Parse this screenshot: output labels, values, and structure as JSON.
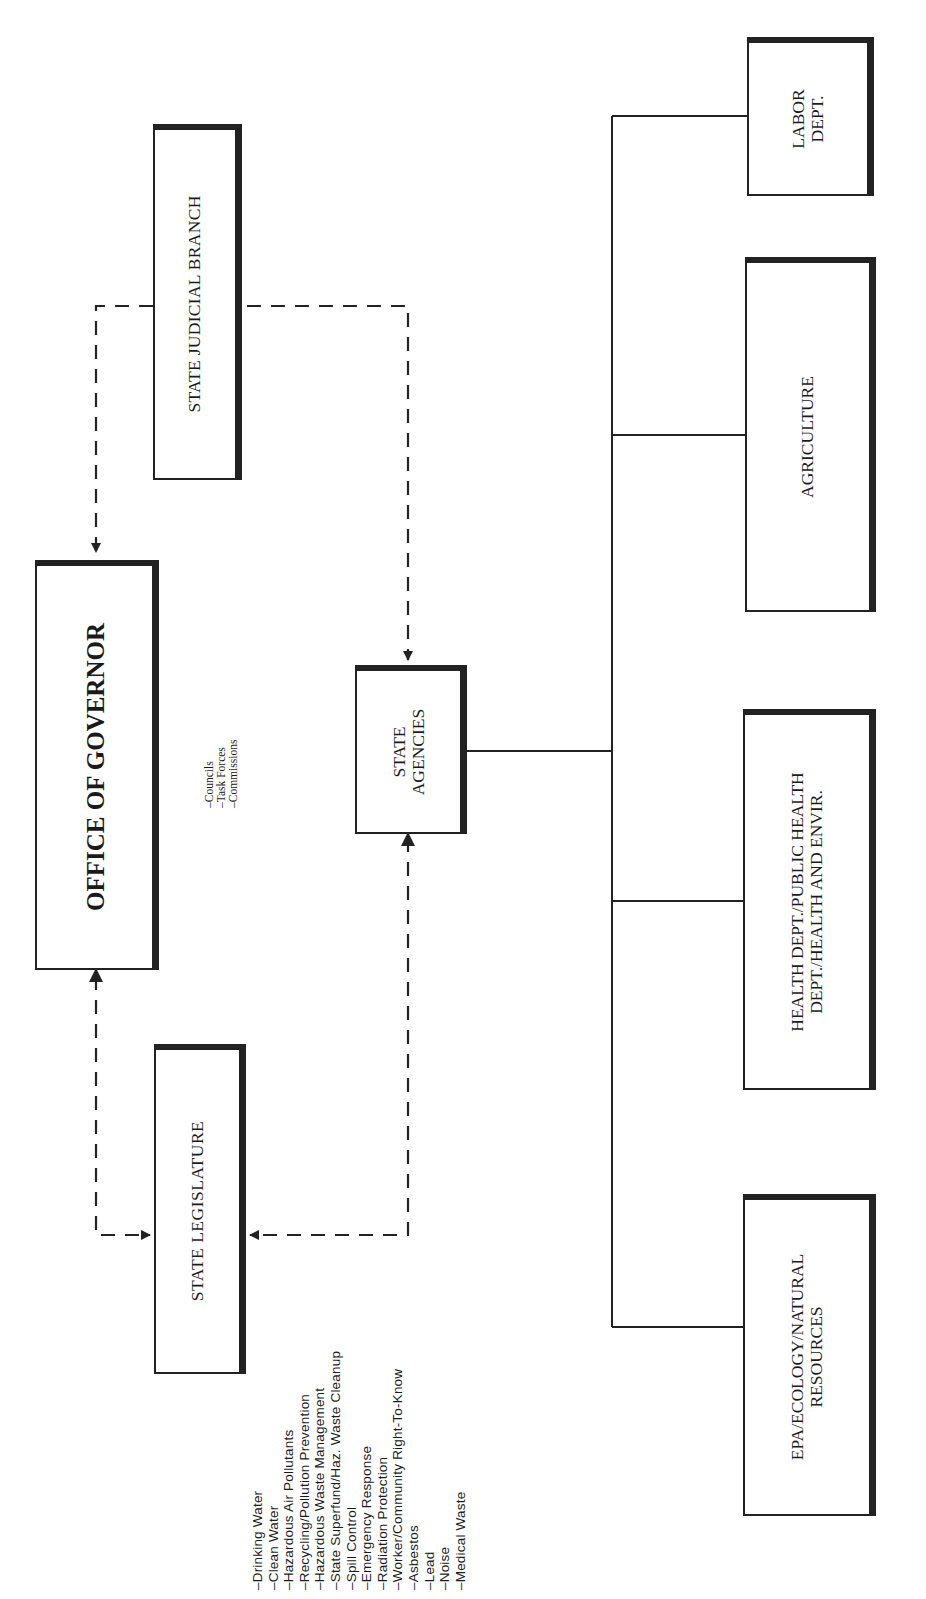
{
  "diagram": {
    "type": "organizational-chart",
    "orientation": "rotated-90-counterclockwise",
    "nodes": {
      "governor": {
        "label": "OFFICE OF GOVERNOR",
        "sub_items": [
          "–Councils",
          "–Task Forces",
          "–Commissions"
        ]
      },
      "judicial": {
        "label": "STATE JUDICIAL BRANCH"
      },
      "legislature": {
        "label": "STATE  LEGISLATURE",
        "program_list": [
          "–Drinking  Water",
          "–Clean  Water",
          "–Hazardous  Air  Pollutants",
          "–Recycling/Pollution  Prevention",
          "–Hazardous  Waste  Management",
          "–State  Superfund/Haz.  Waste  Cleanup",
          "–Spill  Control",
          "–Emergency  Response",
          "–Radiation  Protection",
          "–Worker/Community  Right-To-Know",
          "–Asbestos",
          "–Lead",
          "–Noise",
          "–Medical  Waste"
        ]
      },
      "agencies": {
        "label_line1": "STATE",
        "label_line2": "AGENCIES"
      },
      "labor": {
        "label_line1": "LABOR",
        "label_line2": "DEPT."
      },
      "agriculture": {
        "label": "AGRICULTURE"
      },
      "health": {
        "label_line1": "HEALTH DEPT./PUBLIC HEALTH",
        "label_line2": "DEPT./HEALTH AND ENVIR."
      },
      "epa": {
        "label_line1": "EPA/ECOLOGY/NATURAL",
        "label_line2": "RESOURCES"
      }
    },
    "edges": [
      {
        "from": "judicial",
        "to": "governor",
        "style": "dashed",
        "arrow": "to"
      },
      {
        "from": "judicial",
        "to": "agencies",
        "style": "dashed",
        "arrow": "to"
      },
      {
        "from": "governor",
        "to": "legislature",
        "style": "dashed",
        "arrow": "both"
      },
      {
        "from": "agencies",
        "to": "legislature",
        "style": "dashed",
        "arrow": "both"
      },
      {
        "from": "agencies",
        "to": "labor",
        "style": "solid"
      },
      {
        "from": "agencies",
        "to": "agriculture",
        "style": "solid"
      },
      {
        "from": "agencies",
        "to": "health",
        "style": "solid"
      },
      {
        "from": "agencies",
        "to": "epa",
        "style": "solid"
      }
    ],
    "colors": {
      "line": "#222222",
      "background": "#ffffff"
    }
  }
}
